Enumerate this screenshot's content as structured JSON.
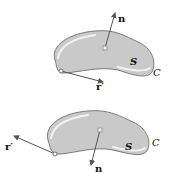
{
  "figures": [
    {
      "id": "top",
      "surface_label": "S",
      "curve_label": "C",
      "normal_label": "n",
      "tangent_label": "r′"
    },
    {
      "id": "bottom",
      "surface_label": "S",
      "curve_label": "C",
      "normal_label": "n",
      "tangent_label": "r′"
    }
  ],
  "colors": {
    "surface_fill": "#c9c9c9",
    "surface_edge": "#7a7a7a",
    "highlight": "#f2f2f2",
    "arrow": "#555555"
  }
}
